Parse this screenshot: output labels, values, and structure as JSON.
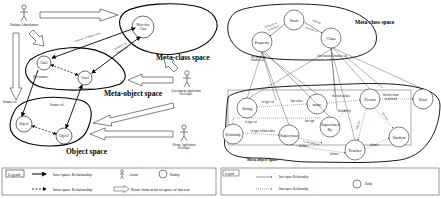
{
  "left_diagram": {
    "spaces": {
      "meta_class": "Meta-class space",
      "meta_object": "Meta-object space",
      "object": "Object space"
    },
    "nodes": {
      "meta_class_class": [
        "Meta-class",
        "Class"
      ],
      "class1": "Class1",
      "class2": "Class2",
      "object1": "Object1",
      "object2": "Object2"
    },
    "actors": {
      "dba": "Database Administrator",
      "gad": [
        "Government Application",
        "Developer"
      ],
      "pad": [
        "Private Application",
        "Developer"
      ]
    },
    "edge_labels": {
      "instance_of_metaclass": "instance of Meta-class",
      "instance_of_metaclass2": [
        "Instance of",
        "Meta-class"
      ],
      "has_instance1": "Has-instance",
      "has_instance2": "Has-instance",
      "instance_of1": "Instance-of",
      "instance_of2": "Instance-of"
    },
    "legend": {
      "title": "Legend",
      "inter": "Inter-space Relationship",
      "intra": "Intra-space Relationship",
      "actor": "Actor",
      "entity": "Entity",
      "route": "Route from actor to space of interest"
    }
  },
  "right_diagram": {
    "spaces": {
      "meta_class": "Meta-class space",
      "meta_object": "Meta-object space"
    },
    "nodes": {
      "root": "Root",
      "property": "Property",
      "class": "Class",
      "string": "String",
      "name": "name",
      "person": "Person",
      "root2": "Root",
      "relationship": "Relationship",
      "supervisor": "Supervisor",
      "supervised_by": [
        "Supervised",
        "By"
      ],
      "teacher": "Teacher",
      "student": "Student"
    },
    "edge_labels": {
      "defined_on_by": [
        "defined on",
        "is defined"
      ],
      "inherits": [
        "inherits",
        "subclass of"
      ],
      "has_property": [
        "has-property",
        "instance of"
      ],
      "has_instance": "has-instance/instance of",
      "is_type_of": "is-type-of",
      "has_value": "has-value",
      "defined_on": "defined on/has",
      "defined_by": "defined-by",
      "inherits_from": [
        "derives from",
        "is derived"
      ],
      "is_type_of2": "is-type-of",
      "is_type_of_has": "is-type-of/has-value",
      "has_type": "has type",
      "is_instance_of": "is-instance-of",
      "defines": "defines",
      "subclass": "subclass",
      "derive": "derives",
      "define2": "defines",
      "define3": "defines"
    },
    "legend": {
      "title": "Legend",
      "inter": "Inter-space Relationship",
      "intra": "Intra-space Relationship",
      "entity": "Entity"
    }
  }
}
